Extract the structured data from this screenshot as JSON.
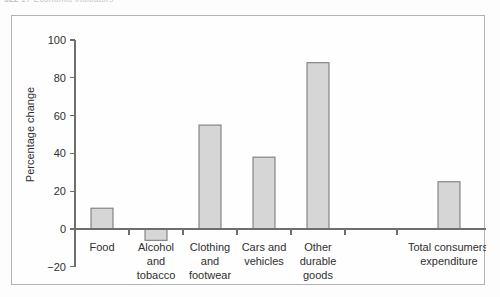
{
  "page": {
    "running_head": "522",
    "running_head_rest": "17 Economic indicators"
  },
  "figure": {
    "frame_name": "chart-frame"
  },
  "chart_data": {
    "type": "bar",
    "title": "",
    "subtitle": "",
    "xlabel": "",
    "ylabel": "Percentage change",
    "ylim": [
      -20,
      100
    ],
    "yticks": [
      -20,
      0,
      20,
      40,
      60,
      80,
      100
    ],
    "ytick_labels": [
      "−20",
      "0",
      "20",
      "40",
      "60",
      "80",
      "100"
    ],
    "grid": false,
    "legend": false,
    "zero_line": 0,
    "bar_color": "#d6d6d6",
    "bar_edge_color": "#7d7d7d",
    "axis_color": "#6e6e6e",
    "categories": [
      "Food",
      "Alcohol and tobacco",
      "Clothing and footwear",
      "Cars and vehicles",
      "Other durable goods",
      "Total consumers' expenditure"
    ],
    "category_label_lines": [
      [
        "Food"
      ],
      [
        "Alcohol",
        "and",
        "tobacco"
      ],
      [
        "Clothing",
        "and",
        "footwear"
      ],
      [
        "Cars and",
        "vehicles"
      ],
      [
        "Other",
        "durable",
        "goods"
      ],
      [
        "Total consumers'",
        "expenditure"
      ]
    ],
    "values": [
      11,
      -6,
      55,
      38,
      88,
      25
    ],
    "series": [
      {
        "name": "Percentage change",
        "values": [
          11,
          -6,
          55,
          38,
          88,
          25
        ]
      }
    ]
  }
}
